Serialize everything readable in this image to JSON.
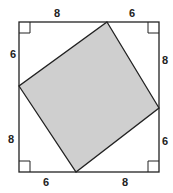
{
  "diagram": {
    "outer_square": {
      "x1": 19,
      "y1": 22,
      "x2": 159,
      "y2": 172,
      "stroke": "#222222"
    },
    "inner_square": {
      "points": "107,22 159,108 76,172 19,86",
      "fill": "#cfcfcf",
      "stroke": "#222222"
    },
    "labels": {
      "top_left": "8",
      "top_right": "6",
      "right_top": "8",
      "right_bottom": "6",
      "bottom_right": "8",
      "bottom_left": "6",
      "left_bottom": "8",
      "left_top": "6"
    },
    "right_angle_markers": 4
  }
}
